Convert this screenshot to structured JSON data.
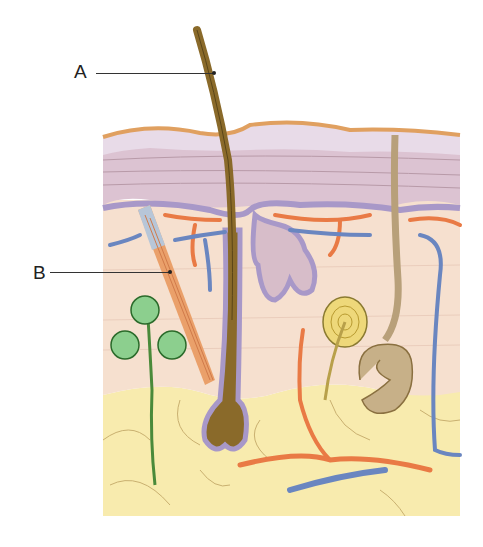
{
  "figure": {
    "labels": [
      {
        "id": "A",
        "text": "A",
        "points_to": "hair shaft"
      },
      {
        "id": "B",
        "text": "B",
        "points_to": "arrector pili muscle"
      }
    ],
    "colors": {
      "epidermis_top": "#e3d0de",
      "epidermis_outline": "#e0a060",
      "dermis": "#f6e0cf",
      "papillary_band": "#a898c8",
      "subcutaneous_fat": "#f8ebae",
      "hair": "#8a6a2a",
      "muscle": "#eaa06a",
      "artery": "#e97a45",
      "vein": "#6a86c0",
      "sweat_gland": "#b8a07a",
      "nerve_receptor": "#e8d070",
      "nerve_plant": "#5aa060"
    }
  }
}
